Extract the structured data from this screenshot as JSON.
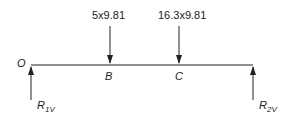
{
  "diagram": {
    "type": "beam-free-body",
    "loads": [
      {
        "label": "5x9.81",
        "point": "B"
      },
      {
        "label": "16.3x9.81",
        "point": "C"
      }
    ],
    "points": {
      "origin": "O",
      "b": "B",
      "c": "C"
    },
    "reactions": [
      {
        "symbol": "R",
        "subscript": "1V"
      },
      {
        "symbol": "R",
        "subscript": "2V"
      }
    ],
    "colors": {
      "line": "#222222",
      "background": "#ffffff"
    }
  }
}
